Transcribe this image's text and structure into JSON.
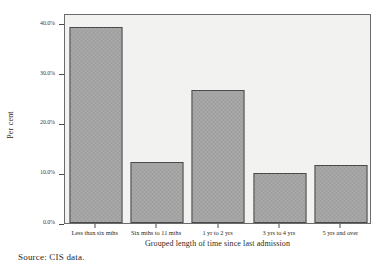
{
  "chart_data": {
    "type": "bar",
    "title": "",
    "xlabel": "Grouped length of time since last admission",
    "ylabel": "Per cent",
    "categories": [
      "Less than six mths",
      "Six mths to 11 mths",
      "1 yr to 2 yrs",
      "3 yrs to 4 yrs",
      "5 yrs and over"
    ],
    "values": [
      39.4,
      12.3,
      26.7,
      10.0,
      11.6
    ],
    "ylim": [
      0,
      42.2
    ],
    "yticks": [
      0,
      10,
      20,
      30,
      40
    ],
    "ytick_labels": [
      "0.0%",
      "10.0%",
      "20.0%",
      "30.0%",
      "40.0%"
    ],
    "grid": false,
    "legend": null,
    "plot_background": "#f2f2f0",
    "bar_color": "#a9a9a9",
    "bar_edge_color": "#4a4a4a",
    "axis_color": "#6b6b6b"
  },
  "footer": {
    "source": "Source: CIS data."
  }
}
